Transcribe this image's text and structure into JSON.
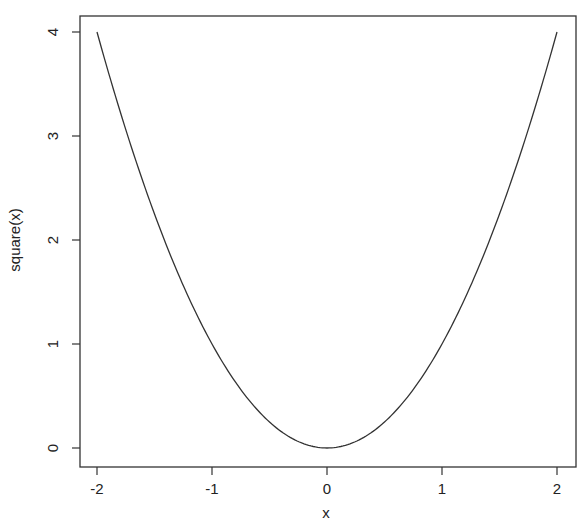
{
  "chart_data": {
    "type": "line",
    "title": "",
    "xlabel": "x",
    "ylabel": "square(x)",
    "xlim": [
      -2,
      2
    ],
    "ylim": [
      0,
      4
    ],
    "grid": false,
    "legend": null,
    "x_ticks": [
      "-2",
      "-1",
      "0",
      "1",
      "2"
    ],
    "y_ticks": [
      "0",
      "1",
      "2",
      "3",
      "4"
    ],
    "series": [
      {
        "name": "square(x)",
        "function": "x^2",
        "x": [
          -2,
          -1.5,
          -1,
          -0.5,
          0,
          0.5,
          1,
          1.5,
          2
        ],
        "y": [
          4,
          2.25,
          1,
          0.25,
          0,
          0.25,
          1,
          2.25,
          4
        ],
        "color": "#333333"
      }
    ]
  }
}
